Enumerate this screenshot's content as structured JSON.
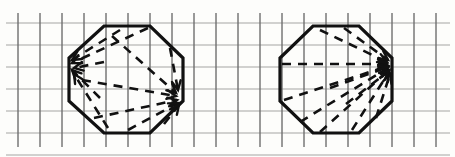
{
  "figure": {
    "width": 455,
    "height": 157,
    "background_color": "#fdfdfb",
    "ink_color": "#111111",
    "grid_color": "#4a4a4a"
  },
  "grid": {
    "label": "square-grid-background",
    "cell_size": 22,
    "origin_x": 18,
    "origin_y": 23,
    "columns": 20,
    "rows": 6,
    "vertical_line_top": 13,
    "vertical_line_bottom": 147,
    "horizontal_line_left": 6,
    "horizontal_line_right": 450,
    "stroke_width": 1.3
  },
  "shapes": [
    {
      "id": "octagon-left",
      "label": "left-octagon",
      "center_x": 127,
      "center_y": 79,
      "radius": 59,
      "rotation_deg": 22.5,
      "stroke_width": 3.2,
      "vertices": [
        [
          104,
          26
        ],
        [
          150,
          26
        ],
        [
          183,
          58
        ],
        [
          183,
          101
        ],
        [
          150,
          133
        ],
        [
          104,
          133
        ],
        [
          69,
          101
        ],
        [
          69,
          58
        ]
      ],
      "convergence_points": [
        {
          "name": "left-vertex-arrow-target",
          "x": 69,
          "y": 64
        },
        {
          "name": "right-vertex-arrow-target",
          "x": 180,
          "y": 97
        }
      ],
      "dashed_vectors": [
        {
          "from": [
            148,
            28
          ],
          "to": [
            72,
            63
          ],
          "arrow_at": "to"
        },
        {
          "from": [
            120,
            30
          ],
          "to": [
            72,
            60
          ],
          "arrow_at": "to"
        },
        {
          "from": [
            104,
            62
          ],
          "to": [
            74,
            68
          ],
          "arrow_at": "to"
        },
        {
          "from": [
            100,
            98
          ],
          "to": [
            72,
            70
          ],
          "arrow_at": "to"
        },
        {
          "from": [
            108,
            128
          ],
          "to": [
            74,
            74
          ],
          "arrow_at": "to"
        },
        {
          "from": [
            112,
            36
          ],
          "to": [
            176,
            93
          ],
          "arrow_at": "to"
        },
        {
          "from": [
            82,
            80
          ],
          "to": [
            176,
            96
          ],
          "arrow_at": "to"
        },
        {
          "from": [
            94,
            118
          ],
          "to": [
            177,
            100
          ],
          "arrow_at": "to"
        },
        {
          "from": [
            128,
            130
          ],
          "to": [
            178,
            103
          ],
          "arrow_at": "to"
        },
        {
          "from": [
            164,
            124
          ],
          "to": [
            179,
            105
          ],
          "arrow_at": "to"
        },
        {
          "from": [
            170,
            48
          ],
          "to": [
            178,
            90
          ],
          "arrow_at": "to"
        }
      ]
    },
    {
      "id": "octagon-right",
      "label": "right-octagon",
      "center_x": 336,
      "center_y": 79,
      "radius": 59,
      "rotation_deg": 22.5,
      "stroke_width": 3.2,
      "vertices": [
        [
          313,
          26
        ],
        [
          359,
          26
        ],
        [
          392,
          58
        ],
        [
          392,
          101
        ],
        [
          359,
          133
        ],
        [
          313,
          133
        ],
        [
          280,
          101
        ],
        [
          280,
          58
        ]
      ],
      "convergence_points": [
        {
          "name": "right-vertex-arrow-target",
          "x": 391,
          "y": 64
        }
      ],
      "dashed_vectors": [
        {
          "from": [
            282,
            64
          ],
          "to": [
            387,
            64
          ],
          "arrow_at": "to"
        },
        {
          "from": [
            320,
            30
          ],
          "to": [
            387,
            62
          ],
          "arrow_at": "to"
        },
        {
          "from": [
            344,
            28
          ],
          "to": [
            388,
            60
          ],
          "arrow_at": "to"
        },
        {
          "from": [
            284,
            100
          ],
          "to": [
            388,
            66
          ],
          "arrow_at": "to"
        },
        {
          "from": [
            300,
            122
          ],
          "to": [
            388,
            68
          ],
          "arrow_at": "to"
        },
        {
          "from": [
            320,
            132
          ],
          "to": [
            389,
            70
          ],
          "arrow_at": "to"
        },
        {
          "from": [
            352,
            130
          ],
          "to": [
            389,
            72
          ],
          "arrow_at": "to"
        },
        {
          "from": [
            376,
            118
          ],
          "to": [
            390,
            74
          ],
          "arrow_at": "to"
        },
        {
          "from": [
            330,
            88
          ],
          "to": [
            388,
            67
          ],
          "arrow_at": "to"
        },
        {
          "from": [
            346,
            104
          ],
          "to": [
            389,
            71
          ],
          "arrow_at": "to"
        }
      ]
    }
  ],
  "annotations": {
    "dash_pattern": "9 7",
    "arrow_length": 10,
    "arrow_spread_deg": 26
  }
}
